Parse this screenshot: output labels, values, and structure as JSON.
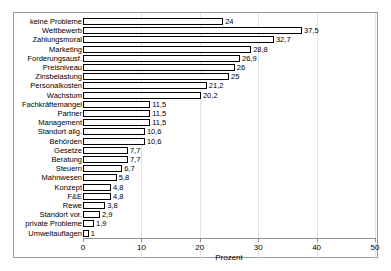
{
  "chart_data": {
    "type": "bar",
    "orientation": "horizontal",
    "title": "",
    "xlabel": "Prozent",
    "ylabel": "",
    "xlim": [
      0,
      50
    ],
    "xticks": [
      0,
      10,
      20,
      30,
      40,
      50
    ],
    "xtick_labels": [
      "0",
      "10",
      "20",
      "30",
      "40",
      "50"
    ],
    "grid": "vertical",
    "legend": "none",
    "bar_style": {
      "fill": "#ffffff",
      "edge": "#000000"
    },
    "decimal_separator": ",",
    "categories": [
      "keine Probleme",
      "Wettbewerb",
      "Zahlungsmoral",
      "Marketing",
      "Forderungsausf.",
      "Preisniveau",
      "Zinsbelastung",
      "Personalkosten",
      "Wachstum",
      "Fachkräftemangel",
      "Partner",
      "Management",
      "Standort allg.",
      "Behörden",
      "Gesetze",
      "Beratung",
      "Steuern",
      "Mahnwesen",
      "Konzept",
      "F&E",
      "Rewe",
      "Standort vor.",
      "private Probleme",
      "Umweltauflagen"
    ],
    "values": [
      24,
      37.5,
      32.7,
      28.8,
      26.9,
      26,
      25,
      21.2,
      20.2,
      11.5,
      11.5,
      11.5,
      10.6,
      10.6,
      7.7,
      7.7,
      6.7,
      5.8,
      4.8,
      4.8,
      3.8,
      2.9,
      1.9,
      1
    ],
    "value_labels": [
      "24",
      "37,5",
      "32,7",
      "28,8",
      "26,9",
      "26",
      "25",
      "21,2",
      "20,2",
      "11,5",
      "11,5",
      "11,5",
      "10,6",
      "10,6",
      "7,7",
      "7,7",
      "6,7",
      "5,8",
      "4,8",
      "4,8",
      "3,8",
      "2,9",
      "1,9",
      "1"
    ]
  }
}
